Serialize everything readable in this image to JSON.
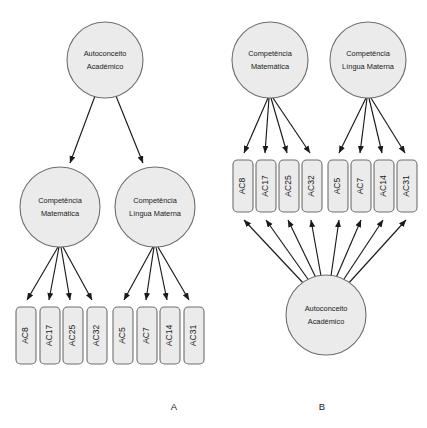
{
  "figure": {
    "background_color": "#ffffff",
    "node_fill": "#ebebeb",
    "node_stroke": "#6e6e6e",
    "arrow_color": "#1a1a1a"
  },
  "panels": [
    {
      "caption": "A",
      "model_type": "higher-order",
      "caption_x": 174,
      "caption_y": 407,
      "latent_nodes": [
        {
          "id": "a-general",
          "line1": "Autoconceito",
          "line2": "Académico",
          "cx": 105,
          "cy": 60,
          "r": 38
        },
        {
          "id": "a-math",
          "line1": "Competência",
          "line2": "Matemática",
          "cx": 60,
          "cy": 207,
          "r": 40
        },
        {
          "id": "a-lang",
          "line1": "Competência",
          "line2": "Língua Materna",
          "cx": 155,
          "cy": 207,
          "r": 40
        }
      ],
      "indicators": [
        {
          "id": "a-ac8",
          "label": "AC8",
          "x": 16,
          "y": 307,
          "w": 20,
          "h": 57
        },
        {
          "id": "a-ac17",
          "label": "AC17",
          "x": 40,
          "y": 307,
          "w": 20,
          "h": 57
        },
        {
          "id": "a-ac25",
          "label": "AC25",
          "x": 63,
          "y": 307,
          "w": 20,
          "h": 57
        },
        {
          "id": "a-ac32",
          "label": "AC32",
          "x": 87,
          "y": 307,
          "w": 20,
          "h": 57
        },
        {
          "id": "a-ac5",
          "label": "AC5",
          "x": 113,
          "y": 307,
          "w": 20,
          "h": 57
        },
        {
          "id": "a-ac7",
          "label": "AC7",
          "x": 137,
          "y": 307,
          "w": 20,
          "h": 57
        },
        {
          "id": "a-ac14",
          "label": "AC14",
          "x": 160,
          "y": 307,
          "w": 20,
          "h": 57
        },
        {
          "id": "a-ac31",
          "label": "AC31",
          "x": 184,
          "y": 307,
          "w": 20,
          "h": 57
        }
      ],
      "paths": [
        {
          "from": "a-general",
          "to": "a-math",
          "x1": 95,
          "y1": 96,
          "x2": 70,
          "y2": 163
        },
        {
          "from": "a-general",
          "to": "a-lang",
          "x1": 116,
          "y1": 96,
          "x2": 143,
          "y2": 163
        },
        {
          "from": "a-math",
          "to": "a-ac8",
          "x1": 58,
          "y1": 247,
          "x2": 27,
          "y2": 300
        },
        {
          "from": "a-math",
          "to": "a-ac17",
          "x1": 59,
          "y1": 247,
          "x2": 49,
          "y2": 300
        },
        {
          "from": "a-math",
          "to": "a-ac25",
          "x1": 61,
          "y1": 247,
          "x2": 70,
          "y2": 300
        },
        {
          "from": "a-math",
          "to": "a-ac32",
          "x1": 63,
          "y1": 247,
          "x2": 92,
          "y2": 300
        },
        {
          "from": "a-lang",
          "to": "a-ac5",
          "x1": 153,
          "y1": 247,
          "x2": 124,
          "y2": 300
        },
        {
          "from": "a-lang",
          "to": "a-ac7",
          "x1": 154,
          "y1": 247,
          "x2": 146,
          "y2": 300
        },
        {
          "from": "a-lang",
          "to": "a-ac14",
          "x1": 156,
          "y1": 247,
          "x2": 167,
          "y2": 300
        },
        {
          "from": "a-lang",
          "to": "a-ac31",
          "x1": 158,
          "y1": 247,
          "x2": 189,
          "y2": 300
        }
      ]
    },
    {
      "caption": "B",
      "model_type": "bifactor",
      "caption_x": 322,
      "caption_y": 407,
      "latent_nodes": [
        {
          "id": "b-math",
          "line1": "Competência",
          "line2": "Matemática",
          "cx": 270,
          "cy": 60,
          "r": 38
        },
        {
          "id": "b-lang",
          "line1": "Competência",
          "line2": "Língua Materna",
          "cx": 368,
          "cy": 60,
          "r": 38
        },
        {
          "id": "b-general",
          "line1": "Autoconceito",
          "line2": "Académico",
          "cx": 326,
          "cy": 315,
          "r": 40
        }
      ],
      "indicators": [
        {
          "id": "b-ac8",
          "label": "AC8",
          "x": 233,
          "y": 160,
          "w": 20,
          "h": 52
        },
        {
          "id": "b-ac17",
          "label": "AC17",
          "x": 256,
          "y": 160,
          "w": 20,
          "h": 52
        },
        {
          "id": "b-ac25",
          "label": "AC25",
          "x": 279,
          "y": 160,
          "w": 20,
          "h": 52
        },
        {
          "id": "b-ac32",
          "label": "AC32",
          "x": 302,
          "y": 160,
          "w": 20,
          "h": 52
        },
        {
          "id": "b-ac5",
          "label": "AC5",
          "x": 328,
          "y": 160,
          "w": 20,
          "h": 52
        },
        {
          "id": "b-ac7",
          "label": "AC7",
          "x": 351,
          "y": 160,
          "w": 20,
          "h": 52
        },
        {
          "id": "b-ac14",
          "label": "AC14",
          "x": 374,
          "y": 160,
          "w": 20,
          "h": 52
        },
        {
          "id": "b-ac31",
          "label": "AC31",
          "x": 397,
          "y": 160,
          "w": 20,
          "h": 52
        }
      ],
      "paths": [
        {
          "from": "b-math",
          "to": "b-ac8",
          "x1": 268,
          "y1": 98,
          "x2": 244,
          "y2": 153
        },
        {
          "from": "b-math",
          "to": "b-ac17",
          "x1": 269,
          "y1": 98,
          "x2": 265,
          "y2": 153
        },
        {
          "from": "b-math",
          "to": "b-ac25",
          "x1": 271,
          "y1": 98,
          "x2": 287,
          "y2": 153
        },
        {
          "from": "b-math",
          "to": "b-ac32",
          "x1": 273,
          "y1": 98,
          "x2": 310,
          "y2": 153
        },
        {
          "from": "b-lang",
          "to": "b-ac5",
          "x1": 366,
          "y1": 98,
          "x2": 339,
          "y2": 153
        },
        {
          "from": "b-lang",
          "to": "b-ac7",
          "x1": 367,
          "y1": 98,
          "x2": 360,
          "y2": 153
        },
        {
          "from": "b-lang",
          "to": "b-ac14",
          "x1": 369,
          "y1": 98,
          "x2": 382,
          "y2": 153
        },
        {
          "from": "b-lang",
          "to": "b-ac31",
          "x1": 371,
          "y1": 98,
          "x2": 405,
          "y2": 153
        },
        {
          "from": "b-general",
          "to": "b-ac8",
          "x1": 305,
          "y1": 285,
          "x2": 244,
          "y2": 220
        },
        {
          "from": "b-general",
          "to": "b-ac17",
          "x1": 310,
          "y1": 282,
          "x2": 266,
          "y2": 220
        },
        {
          "from": "b-general",
          "to": "b-ac25",
          "x1": 316,
          "y1": 278,
          "x2": 288,
          "y2": 220
        },
        {
          "from": "b-general",
          "to": "b-ac32",
          "x1": 321,
          "y1": 276,
          "x2": 311,
          "y2": 220
        },
        {
          "from": "b-general",
          "to": "b-ac5",
          "x1": 331,
          "y1": 276,
          "x2": 339,
          "y2": 220
        },
        {
          "from": "b-general",
          "to": "b-ac7",
          "x1": 336,
          "y1": 278,
          "x2": 361,
          "y2": 220
        },
        {
          "from": "b-general",
          "to": "b-ac14",
          "x1": 342,
          "y1": 282,
          "x2": 383,
          "y2": 220
        },
        {
          "from": "b-general",
          "to": "b-ac31",
          "x1": 347,
          "y1": 285,
          "x2": 406,
          "y2": 220
        }
      ]
    }
  ]
}
